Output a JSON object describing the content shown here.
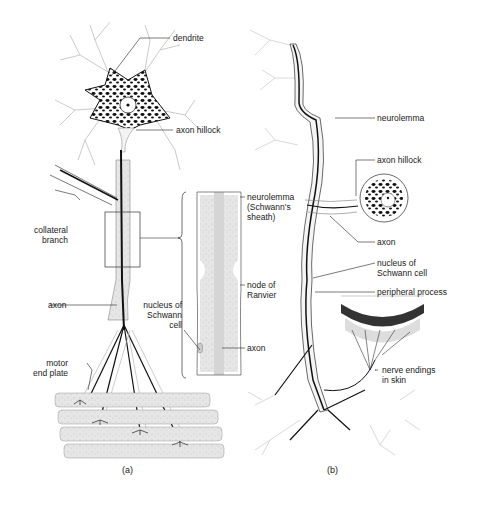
{
  "figure": {
    "panel_a": {
      "caption": "(a)",
      "labels": {
        "dendrite": "dendrite",
        "axon_hillock": "axon hillock",
        "collateral_branch": "collateral\nbranch",
        "axon": "axon",
        "nucleus_schwann": "nucleus of\nSchwann\ncell",
        "motor_end_plate": "motor\nend plate",
        "neurolemma_sheath": "neurolemma\n(Schwann's\nsheath)",
        "node_of_ranvier": "node of\nRanvier",
        "inset_axon": "axon"
      }
    },
    "panel_b": {
      "caption": "(b)",
      "labels": {
        "neurolemma": "neurolemma",
        "axon_hillock": "axon hillock",
        "axon": "axon",
        "nucleus_schwann": "nucleus of\nSchwann cell",
        "peripheral_process": "peripheral process",
        "nerve_endings": "nerve endings\nin skin"
      }
    }
  }
}
